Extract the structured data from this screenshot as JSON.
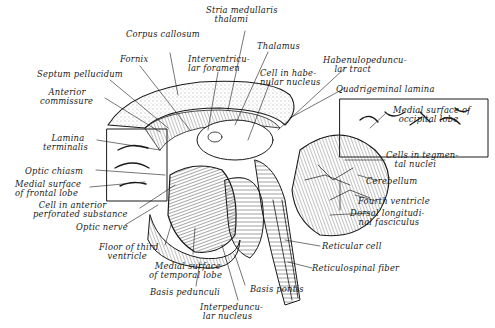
{
  "figure": {
    "type": "anatomical-illustration",
    "colors": {
      "ink": "#1a1a1a",
      "background": "#ffffff"
    }
  },
  "labels": {
    "stria_medullaris": "Stria medullaris\n   thalami",
    "corpus_callosum": "Corpus callosum",
    "fornix": "Fornix",
    "interventricular_foramen": "Interventricu-\nlar foramen",
    "thalamus": "Thalamus",
    "septum_pellucidum": "Septum pellucidum",
    "cell_habenular": "Cell in habe-\nnular nucleus",
    "habenulopeduncular": "Habenulopeduncu-\n    lar tract",
    "anterior_commissure": "   Anterior\ncommissure",
    "quadrigeminal_lamina": "Quadrigeminal lamina",
    "medial_occipital": "Medial surface of\n  occipital lobe",
    "lamina_terminalis": "   Lamina\nterminalis",
    "cells_tegmental": "Cells in tegmen-\n   tal nuclei",
    "optic_chiasm": "Optic chiasm",
    "medial_frontal": "Medial surface\nof frontal lobe",
    "cerebellum": "Cerebellum",
    "cell_anterior_perforated": "  Cell in anterior\nperforated substance",
    "fourth_ventricle": "Fourth ventricle",
    "dorsal_longitudinal": "Dorsal longitudi-\n   nal fasciculus",
    "optic_nerve": "Optic nerve",
    "floor_third_ventricle": "Floor of third\n   ventricle",
    "reticular_cell": "Reticular cell",
    "medial_temporal": "  Medial surface\nof temporal lobe",
    "reticulospinal_fiber": "Reticulospinal fiber",
    "basis_pedunculi": "Basis pedunculi",
    "basis_pontis": "Basis pontis",
    "interpeduncular_nucleus": "Interpeduncu-\n lar nucleus"
  }
}
